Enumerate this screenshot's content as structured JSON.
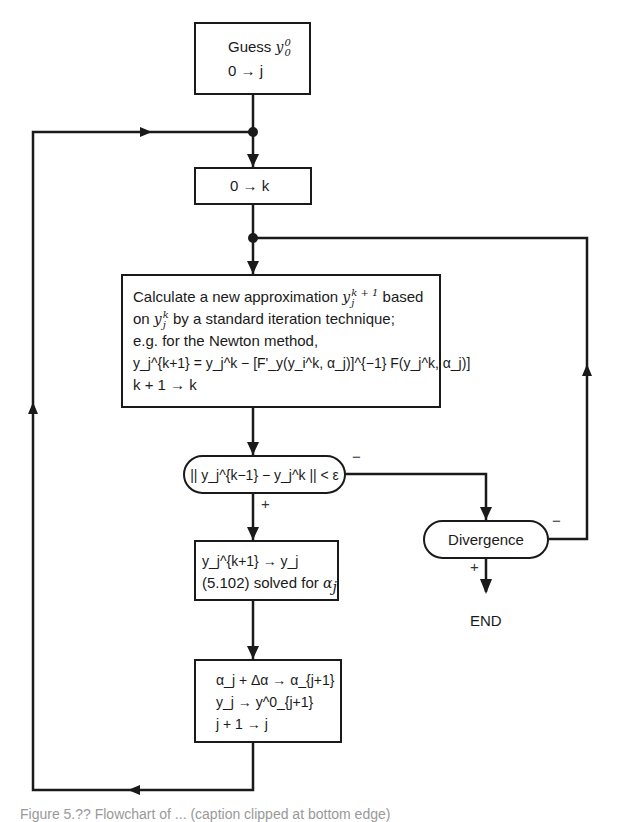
{
  "diagram": {
    "type": "flowchart",
    "nodes": {
      "start": {
        "line1_text": "Guess",
        "line1_var": "y",
        "line1_sup": "0",
        "line1_sub": "0",
        "line2": "0 → j"
      },
      "init_k": {
        "text": "0 → k"
      },
      "calculate": {
        "line1_text": "Calculate a new approximation",
        "line1_var": "y",
        "line1_sup": "k + 1",
        "line1_sub": "j",
        "line1_tail": "based",
        "line2_head": "on",
        "line2_var": "y",
        "line2_sup": "k",
        "line2_sub": "j",
        "line2_tail": "by a standard iteration technique;",
        "line3": "e.g.  for the Newton method,",
        "line4": "y_j^{k+1} = y_j^k − [F'_y(y_i^k, α_j)]^{−1} F(y_j^k, α_j)]",
        "line5": "k + 1 → k"
      },
      "convergence_test": {
        "text": "|| y_j^{k−1} − y_j^k || < ε"
      },
      "divergence": {
        "text": "Divergence"
      },
      "end": {
        "text": "END"
      },
      "update_y": {
        "line1": "y_j^{k+1} → y_j",
        "line2_text": "(5.102) solved for",
        "line2_var": "α",
        "line2_sub": "j"
      },
      "update_alpha": {
        "line1": "α_j + Δα → α_{j+1}",
        "line2": "y_j → y^0_{j+1}",
        "line3": "j + 1 → j"
      }
    },
    "branch_labels": {
      "convergence_no": "−",
      "convergence_yes": "+",
      "divergence_no": "−",
      "divergence_yes": "+"
    },
    "caption": "Figure 5.?? Flowchart of ... (caption clipped at bottom edge)"
  }
}
